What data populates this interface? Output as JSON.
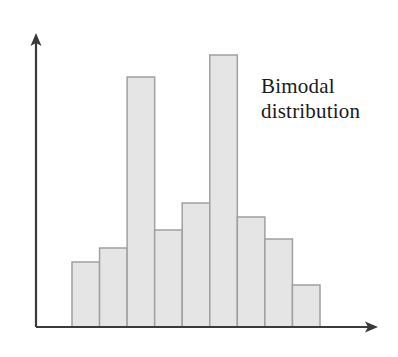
{
  "figure": {
    "background_color": "#ffffff",
    "annotation": {
      "line1": "Bimodal",
      "line2": "distribution",
      "color": "#1a1a1a"
    },
    "axes": {
      "color": "#3a3a3a",
      "y_axis_arrow": "arrow-up-icon",
      "x_axis_arrow": "arrow-right-icon",
      "x_axis_y": 327,
      "y_axis_x": 36,
      "x_axis_end": 378,
      "y_axis_top": 33
    },
    "bar_style": {
      "fill": "#e5e5e5",
      "stroke": "#a0a0a0",
      "stroke_width": 1.5,
      "plot_left": 72,
      "plot_right": 320
    }
  },
  "chart_data": {
    "type": "bar",
    "title": "",
    "subtitle": "",
    "xlabel": "",
    "ylabel": "",
    "annotations": [
      "Bimodal distribution"
    ],
    "grid": false,
    "legend": false,
    "axis_ticks": false,
    "categories": [
      "1",
      "2",
      "3",
      "4",
      "5",
      "6",
      "7",
      "8",
      "9"
    ],
    "values": [
      65,
      79,
      250,
      97,
      124,
      272,
      110,
      88,
      42
    ],
    "ylim": [
      0,
      294
    ],
    "xlim": [
      0,
      9
    ]
  }
}
